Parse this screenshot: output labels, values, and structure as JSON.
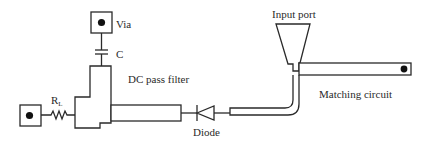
{
  "diagram": {
    "type": "microstrip rectifier circuit layout",
    "labels": {
      "via": "Via",
      "capacitor": "C",
      "resistor": "R",
      "resistor_subscript": "L",
      "dc_pass_filter": "DC pass filter",
      "diode": "Diode",
      "input_port": "Input port",
      "matching_circuit": "Matching circuit"
    },
    "colors": {
      "stroke": "#2a2a2a",
      "fill": "#ffffff",
      "dot": "#111111"
    }
  }
}
